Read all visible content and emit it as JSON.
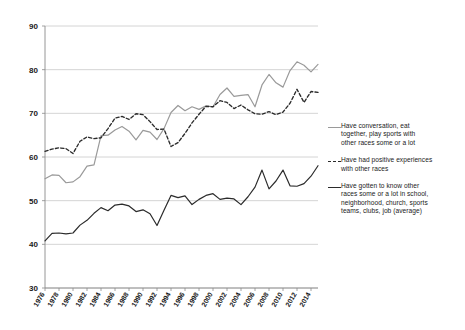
{
  "chart_data": {
    "type": "line",
    "title": "",
    "subtitle": "",
    "xlabel": "",
    "ylabel": "",
    "xlim": [
      1976,
      2015
    ],
    "ylim": [
      30,
      90
    ],
    "yticks": [
      30,
      40,
      50,
      60,
      70,
      80,
      90
    ],
    "xticks": [
      1976,
      1978,
      1980,
      1982,
      1984,
      1986,
      1988,
      1990,
      1992,
      1994,
      1996,
      1998,
      2000,
      2002,
      2004,
      2006,
      2008,
      2010,
      2012,
      2014
    ],
    "grid": true,
    "legend_position": "right",
    "x": [
      1976,
      1977,
      1978,
      1979,
      1980,
      1981,
      1982,
      1983,
      1984,
      1985,
      1986,
      1987,
      1988,
      1989,
      1990,
      1991,
      1992,
      1993,
      1994,
      1995,
      1996,
      1997,
      1998,
      1999,
      2000,
      2001,
      2002,
      2003,
      2004,
      2005,
      2006,
      2007,
      2008,
      2009,
      2010,
      2011,
      2012,
      2013,
      2014,
      2015
    ],
    "series": [
      {
        "name": "Have conversation, eat together, play sports with other races some or a lot",
        "style": "solid",
        "color": "#9a9a9a",
        "values": [
          55.0,
          55.9,
          55.8,
          54.1,
          54.3,
          55.5,
          57.9,
          58.2,
          64.9,
          65.0,
          66.2,
          67.0,
          65.9,
          63.9,
          66.1,
          65.7,
          64.0,
          66.5,
          70.2,
          71.8,
          70.6,
          71.5,
          70.9,
          71.7,
          71.5,
          74.3,
          75.8,
          73.9,
          74.1,
          74.3,
          71.5,
          76.5,
          78.9,
          77.0,
          76.0,
          79.8,
          81.8,
          81.0,
          79.5,
          81.2
        ]
      },
      {
        "name": "Have had positive experiences with other races",
        "style": "dashed",
        "color": "#2b2b2b",
        "values": [
          61.3,
          61.8,
          62.1,
          61.9,
          60.8,
          63.6,
          64.6,
          64.2,
          64.4,
          66.5,
          68.9,
          69.3,
          68.6,
          69.9,
          69.7,
          68.1,
          66.3,
          66.4,
          62.4,
          63.3,
          65.4,
          67.8,
          69.8,
          71.6,
          71.5,
          72.9,
          72.5,
          71.1,
          71.9,
          70.8,
          69.9,
          69.8,
          70.4,
          69.7,
          70.3,
          72.3,
          75.5,
          72.5,
          75.0,
          74.8
        ]
      },
      {
        "name": "Have gotten to know other races some or a lot in school, neighborhood, church, sports teams, clubs, job (average)",
        "style": "solid",
        "color": "#2b2b2b",
        "values": [
          40.8,
          42.5,
          42.6,
          42.4,
          42.6,
          44.4,
          45.5,
          47.1,
          48.4,
          47.7,
          49.0,
          49.2,
          48.8,
          47.5,
          47.9,
          47.0,
          44.3,
          47.8,
          51.2,
          50.7,
          51.1,
          49.1,
          50.3,
          51.2,
          51.6,
          50.3,
          50.6,
          50.4,
          49.1,
          50.9,
          53.1,
          57.0,
          52.7,
          54.5,
          57.0,
          53.4,
          53.3,
          53.9,
          55.6,
          58.0
        ]
      }
    ],
    "legend": [
      {
        "label": "Have conversation, eat\ntogether, play sports with\nother races some or a lot",
        "style": "solid",
        "color": "#9a9a9a"
      },
      {
        "label": "Have had positive experiences\nwith other races",
        "style": "dashed",
        "color": "#2b2b2b"
      },
      {
        "label": "Have gotten to know other\nraces some or a lot in school,\nneighborhood, church, sports\nteams, clubs, job (average)",
        "style": "solid",
        "color": "#2b2b2b"
      }
    ]
  }
}
